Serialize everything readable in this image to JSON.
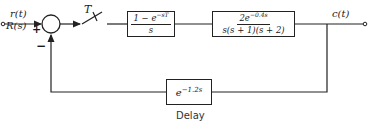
{
  "diagram": {
    "type": "sampled-data feedback control block diagram",
    "input": {
      "time_label": "r(t)",
      "laplace_label": "R(s)"
    },
    "summing_junction": {
      "plus_sign": "+",
      "minus_sign": "−"
    },
    "sampler": {
      "label": "T"
    },
    "blocks": [
      {
        "id": "zoh",
        "numerator": "1 − e",
        "numerator_exp": "−sT",
        "denominator": "s"
      },
      {
        "id": "plant",
        "numerator": "2e",
        "numerator_exp": "−0.4s",
        "denominator": "s(s + 1)(s + 2)"
      }
    ],
    "feedback": {
      "base": "e",
      "exponent": "−1.2s",
      "caption": "Delay"
    },
    "output": {
      "label": "c(t)"
    }
  },
  "colors": {
    "line": "#222222",
    "background": "#ffffff"
  }
}
